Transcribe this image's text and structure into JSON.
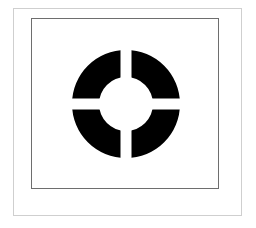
{
  "figure": {
    "icon": "lifebuoy-ring-icon",
    "colors": {
      "ring": "#000000",
      "background": "#ffffff",
      "outer_frame": "#cfcfcf",
      "inner_frame": "#6e6e6e"
    },
    "ring": {
      "center_x": 126,
      "center_y": 104,
      "outer_radius": 54,
      "inner_radius": 27,
      "gap_width": 11,
      "segments": 4
    }
  }
}
